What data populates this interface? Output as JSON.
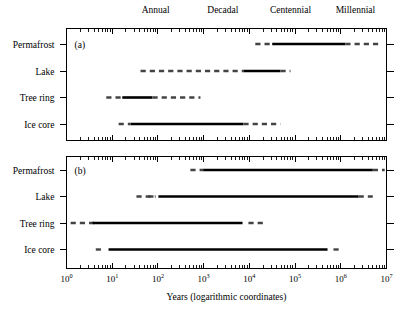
{
  "figure": {
    "xaxis_title": "Years (logarithmic coordinates)",
    "era_labels": [
      {
        "text": "Annual",
        "x": 1.95
      },
      {
        "text": "Decadal",
        "x": 3.42
      },
      {
        "text": "Centennial",
        "x": 4.9
      },
      {
        "text": "Millennial",
        "x": 6.32
      }
    ],
    "tick_labels": [
      {
        "base": "10",
        "exp": "0",
        "value": 0
      },
      {
        "base": "10",
        "exp": "1",
        "value": 1
      },
      {
        "base": "10",
        "exp": "2",
        "value": 2
      },
      {
        "base": "10",
        "exp": "3",
        "value": 3
      },
      {
        "base": "10",
        "exp": "4",
        "value": 4
      },
      {
        "base": "10",
        "exp": "5",
        "value": 5
      },
      {
        "base": "10",
        "exp": "6",
        "value": 6
      },
      {
        "base": "10",
        "exp": "7",
        "value": 7
      }
    ],
    "panels": [
      {
        "tag": "(a)",
        "rows": [
          "Permafrost",
          "Lake",
          "Tree ring",
          "Ice core"
        ]
      },
      {
        "tag": "(b)",
        "rows": [
          "Permafrost",
          "Lake",
          "Tree ring",
          "Ice core"
        ]
      }
    ]
  },
  "chart_data": {
    "type": "bar",
    "title": "",
    "subtitle": "",
    "xlabel": "Years (logarithmic coordinates)",
    "ylabel": "",
    "xscale": "log",
    "xlim": [
      1,
      10000000
    ],
    "xlim_log10": [
      0,
      7
    ],
    "grid": false,
    "legend": null,
    "axis_annotations": [
      "Annual",
      "Decadal",
      "Centennial",
      "Millennial"
    ],
    "categories": [
      "Permafrost",
      "Lake",
      "Tree ring",
      "Ice core"
    ],
    "panels": [
      {
        "name": "(a)",
        "description": "Temporal resolution / coverage ranges by archive (panel a)",
        "series": [
          {
            "name": "Permafrost",
            "segments": [
              {
                "style": "dashed",
                "start_log10": 4.13,
                "end_log10": 4.5
              },
              {
                "style": "solid",
                "start_log10": 4.5,
                "end_log10": 6.1
              },
              {
                "style": "dashed",
                "start_log10": 6.1,
                "end_log10": 6.87
              }
            ]
          },
          {
            "name": "Lake",
            "segments": [
              {
                "style": "dashed",
                "start_log10": 1.62,
                "end_log10": 3.87
              },
              {
                "style": "solid",
                "start_log10": 3.87,
                "end_log10": 4.68
              },
              {
                "style": "dashed",
                "start_log10": 4.68,
                "end_log10": 4.9
              }
            ]
          },
          {
            "name": "Tree ring",
            "segments": [
              {
                "style": "dashed",
                "start_log10": 0.87,
                "end_log10": 1.22
              },
              {
                "style": "solid",
                "start_log10": 1.22,
                "end_log10": 1.88
              },
              {
                "style": "dashed",
                "start_log10": 1.88,
                "end_log10": 2.93
              }
            ]
          },
          {
            "name": "Ice core",
            "segments": [
              {
                "style": "dashed",
                "start_log10": 1.14,
                "end_log10": 1.4
              },
              {
                "style": "solid",
                "start_log10": 1.4,
                "end_log10": 3.87
              },
              {
                "style": "dashed",
                "start_log10": 3.87,
                "end_log10": 4.68
              }
            ]
          }
        ]
      },
      {
        "name": "(b)",
        "description": "Temporal resolution / coverage ranges by archive (panel b)",
        "series": [
          {
            "name": "Permafrost",
            "segments": [
              {
                "style": "dashed",
                "start_log10": 2.71,
                "end_log10": 2.99
              },
              {
                "style": "solid",
                "start_log10": 2.99,
                "end_log10": 6.7
              },
              {
                "style": "dashed",
                "start_log10": 6.7,
                "end_log10": 6.96
              }
            ]
          },
          {
            "name": "Lake",
            "segments": [
              {
                "style": "dashed",
                "start_log10": 1.53,
                "end_log10": 1.95
              },
              {
                "style": "dashed",
                "start_log10": 1.79,
                "end_log10": 1.95
              },
              {
                "style": "solid",
                "start_log10": 2.01,
                "end_log10": 6.39
              },
              {
                "style": "dashed",
                "start_log10": 6.39,
                "end_log10": 6.7
              }
            ]
          },
          {
            "name": "Tree ring",
            "segments": [
              {
                "style": "dashed",
                "start_log10": 0.09,
                "end_log10": 0.62
              },
              {
                "style": "solid",
                "start_log10": 0.57,
                "end_log10": 3.85
              },
              {
                "style": "dashed",
                "start_log10": 3.98,
                "end_log10": 4.36
              }
            ]
          },
          {
            "name": "Ice core",
            "segments": [
              {
                "style": "dashed",
                "start_log10": 0.64,
                "end_log10": 0.83
              },
              {
                "style": "solid",
                "start_log10": 0.92,
                "end_log10": 5.71
              },
              {
                "style": "dashed",
                "start_log10": 5.84,
                "end_log10": 6.04
              }
            ]
          }
        ]
      }
    ]
  }
}
